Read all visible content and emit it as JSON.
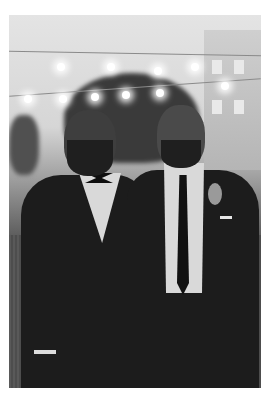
{
  "image": {
    "description": "Black-and-white photo of two bearded men in dark suits posing outdoors at an evening event under string lights",
    "style": "grayscale",
    "border_color": "#ffffff",
    "subjects": [
      {
        "position": "left",
        "attire": "dark tuxedo with white shirt and bow tie"
      },
      {
        "position": "right",
        "attire": "dark suit with white shirt, black necktie and boutonniere"
      }
    ],
    "background_elements": [
      "string lights",
      "large tree",
      "building",
      "crowd",
      "grass lawn"
    ]
  }
}
